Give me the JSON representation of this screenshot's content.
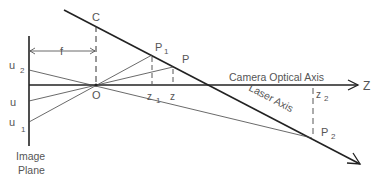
{
  "diagram": {
    "labels": {
      "c": "C",
      "f": "f",
      "o": "O",
      "p1": "P",
      "p1_sub": "1",
      "p": "P",
      "p2": "P",
      "p2_sub": "2",
      "z1": "z",
      "z1_sub": "1",
      "z": "z",
      "z2": "z",
      "z2_sub": "2",
      "z_axis": "Z",
      "u2": "u",
      "u2_sub": "2",
      "u": "u",
      "u1": "u",
      "u1_sub": "1",
      "camera_axis": "Camera Optical Axis",
      "laser_axis": "Laser Axis",
      "image_plane_1": "Image",
      "image_plane_2": "Plane"
    },
    "colors": {
      "line": "#222222",
      "text": "#555555",
      "thin": "#444444"
    }
  }
}
